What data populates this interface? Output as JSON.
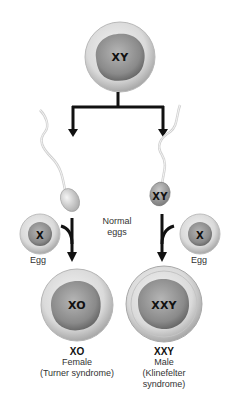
{
  "diagram": {
    "parent_cell": {
      "label": "XY"
    },
    "sperm": [
      {
        "id": "normal-sperm",
        "label": ""
      },
      {
        "id": "xy-sperm",
        "label": "XY"
      }
    ],
    "eggs": [
      {
        "id": "left-egg",
        "label": "X",
        "caption": "Egg"
      },
      {
        "id": "right-egg",
        "label": "X",
        "caption": "Egg"
      }
    ],
    "normal_eggs_label": {
      "line1": "Normal",
      "line2": "eggs"
    },
    "offspring": [
      {
        "id": "xo",
        "label": "XO",
        "title": "XO",
        "sex": "Female",
        "condition_line1": "(Turner syndrome)",
        "condition_line2": ""
      },
      {
        "id": "xxy",
        "label": "XXY",
        "title": "XXY",
        "sex": "Male",
        "condition_line1": "(Klinefelter",
        "condition_line2": "syndrome)"
      }
    ],
    "colors": {
      "arrow": "#111111",
      "membrane": "#dcdcdc",
      "nucleus": "#8c8c8c",
      "background": "#ffffff"
    }
  }
}
